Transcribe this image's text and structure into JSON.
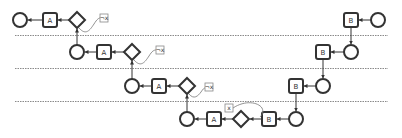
{
  "diagram": {
    "type": "process-flow-swimlanes",
    "lanes": [
      {
        "y": 35
      },
      {
        "y": 68
      },
      {
        "y": 101
      }
    ],
    "rows": [
      {
        "name": "row-1",
        "left": {
          "circle": {
            "x": 20,
            "y": 20
          },
          "activity": {
            "label": "A",
            "x": 50,
            "y": 20
          },
          "gateway": {
            "x": 77,
            "y": 20
          },
          "condition": {
            "label": "¬x",
            "x": 104,
            "y": 18
          }
        },
        "right": {
          "activity": {
            "label": "B",
            "x": 351,
            "y": 20
          },
          "circle": {
            "x": 378,
            "y": 20
          }
        }
      },
      {
        "name": "row-2",
        "left": {
          "circle": {
            "x": 77,
            "y": 52
          },
          "activity": {
            "label": "A",
            "x": 104,
            "y": 52
          },
          "gateway": {
            "x": 132,
            "y": 52
          },
          "condition": {
            "label": "¬x",
            "x": 160,
            "y": 50
          }
        },
        "right": {
          "activity": {
            "label": "B",
            "x": 323,
            "y": 52
          },
          "circle": {
            "x": 351,
            "y": 52
          }
        }
      },
      {
        "name": "row-3",
        "left": {
          "circle": {
            "x": 132,
            "y": 86
          },
          "activity": {
            "label": "A",
            "x": 159,
            "y": 86
          },
          "gateway": {
            "x": 187,
            "y": 86
          },
          "condition": {
            "label": "¬x",
            "x": 209,
            "y": 86
          }
        },
        "right": {
          "activity": {
            "label": "B",
            "x": 296,
            "y": 86
          },
          "circle": {
            "x": 323,
            "y": 86
          }
        }
      },
      {
        "name": "row-4",
        "left": {
          "circle": {
            "x": 187,
            "y": 119
          },
          "activity": {
            "label": "A",
            "x": 214,
            "y": 119
          },
          "gateway": {
            "x": 241,
            "y": 119
          },
          "condition": {
            "label": "x",
            "x": 229,
            "y": 108
          }
        },
        "right": {
          "activity": {
            "label": "B",
            "x": 269,
            "y": 119
          },
          "circle": {
            "x": 296,
            "y": 119
          }
        }
      }
    ],
    "labels": {
      "activity_a": "A",
      "activity_b": "B",
      "cond_not_x": "¬x",
      "cond_x": "x"
    }
  }
}
